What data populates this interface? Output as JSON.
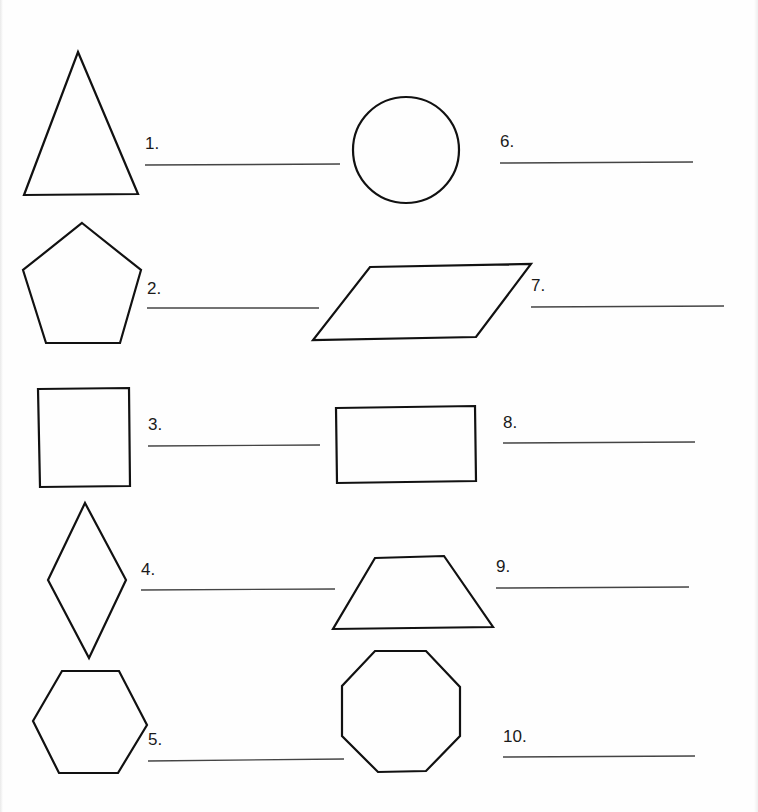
{
  "worksheet": {
    "items": [
      {
        "number": "1.",
        "shape": "triangle"
      },
      {
        "number": "2.",
        "shape": "pentagon"
      },
      {
        "number": "3.",
        "shape": "square"
      },
      {
        "number": "4.",
        "shape": "rhombus"
      },
      {
        "number": "5.",
        "shape": "hexagon"
      },
      {
        "number": "6.",
        "shape": "circle"
      },
      {
        "number": "7.",
        "shape": "parallelogram"
      },
      {
        "number": "8.",
        "shape": "rectangle"
      },
      {
        "number": "9.",
        "shape": "trapezoid"
      },
      {
        "number": "10.",
        "shape": "octagon"
      }
    ],
    "answers": [
      "",
      "",
      "",
      "",
      "",
      "",
      "",
      "",
      "",
      ""
    ],
    "colors": {
      "background": "#fefefe",
      "stroke": "#111111",
      "answer_line": "#444444"
    }
  }
}
